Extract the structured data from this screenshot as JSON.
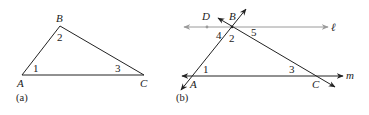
{
  "figure_a": {
    "caption": "(a)",
    "vertices": {
      "A": "A",
      "B": "B",
      "C": "C"
    },
    "angles": {
      "at_A": "1",
      "at_B": "2",
      "at_C": "3"
    }
  },
  "figure_b": {
    "caption": "(b)",
    "points": {
      "A": "A",
      "B": "B",
      "C": "C",
      "D": "D"
    },
    "lines": {
      "top": "ℓ",
      "bottom": "m"
    },
    "angles": {
      "at_A": "1",
      "at_B": "2",
      "at_C": "3",
      "left_of_B": "4",
      "right_of_B": "5"
    }
  },
  "colors": {
    "stroke": "#222222",
    "gray_line": "#9a9a9a"
  }
}
